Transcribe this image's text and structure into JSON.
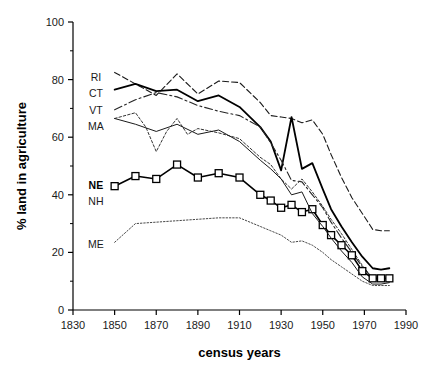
{
  "figure": {
    "background": "#ffffff",
    "ink": "#000000"
  },
  "chart_data": {
    "type": "line",
    "title": "",
    "subtitle": "",
    "xlabel": "census years",
    "ylabel": "% land in agriculture",
    "xlim": [
      1830,
      1990
    ],
    "ylim": [
      0,
      100
    ],
    "xticks": [
      1830,
      1850,
      1870,
      1890,
      1910,
      1930,
      1950,
      1970,
      1990
    ],
    "yticks": [
      0,
      20,
      40,
      60,
      80,
      100
    ],
    "xtick_labels": [
      "1830",
      "1850",
      "1870",
      "1890",
      "1910",
      "1930",
      "1950",
      "1970",
      "1990"
    ],
    "ytick_labels": [
      "0",
      "20",
      "40",
      "60",
      "80",
      "100"
    ],
    "grid": false,
    "legend_position": "inline-left",
    "minor_yticks": [
      10,
      30,
      50,
      70,
      90
    ],
    "series": [
      {
        "name": "RI",
        "label": "RI",
        "style": "dashed",
        "color": "#1a1a1a",
        "width": 1.1,
        "dash": "6,3",
        "marker": "none",
        "label_bold": false,
        "label_xy": [
          1841,
          81
        ],
        "x": [
          1850,
          1860,
          1870,
          1880,
          1890,
          1900,
          1910,
          1920,
          1925,
          1930,
          1935,
          1940,
          1945,
          1950,
          1954,
          1959,
          1964,
          1969,
          1974,
          1978,
          1982
        ],
        "values": [
          82.5,
          78.5,
          74.5,
          82.0,
          75.0,
          79.5,
          79.0,
          72.0,
          67.5,
          67.0,
          66.5,
          65.0,
          66.0,
          61.0,
          54.0,
          46.0,
          39.0,
          33.5,
          28.0,
          27.5,
          27.5
        ]
      },
      {
        "name": "CT",
        "label": "CT",
        "style": "solid",
        "color": "#000000",
        "width": 1.8,
        "dash": "none",
        "marker": "none",
        "label_bold": false,
        "label_xy": [
          1841,
          75.5
        ],
        "x": [
          1850,
          1860,
          1870,
          1880,
          1890,
          1900,
          1910,
          1920,
          1925,
          1930,
          1935,
          1940,
          1945,
          1950,
          1954,
          1959,
          1964,
          1969,
          1974,
          1978,
          1982
        ],
        "values": [
          76.5,
          78.5,
          76.0,
          76.5,
          72.5,
          74.5,
          70.5,
          63.5,
          58.5,
          48.5,
          67.0,
          49.0,
          51.0,
          42.0,
          35.0,
          29.0,
          23.5,
          18.5,
          14.5,
          14.0,
          14.5
        ]
      },
      {
        "name": "VT",
        "label": "VT",
        "style": "dashdot",
        "color": "#262626",
        "width": 1.1,
        "dash": "8,3,2,3",
        "marker": "none",
        "label_bold": false,
        "label_xy": [
          1841,
          69.5
        ],
        "x": [
          1850,
          1860,
          1870,
          1880,
          1890,
          1900,
          1910,
          1920,
          1925,
          1930,
          1935,
          1940,
          1945,
          1950,
          1954,
          1959,
          1964,
          1969,
          1974,
          1978,
          1982
        ],
        "values": [
          69.5,
          73.0,
          75.5,
          74.0,
          71.0,
          69.0,
          67.5,
          63.5,
          58.0,
          52.0,
          45.0,
          44.5,
          40.0,
          35.5,
          30.5,
          25.0,
          20.0,
          15.0,
          11.0,
          10.0,
          10.5
        ]
      },
      {
        "name": "MA",
        "label": "MA",
        "style": "dotted",
        "color": "#333333",
        "width": 1.0,
        "dash": "2.5,2",
        "marker": "none",
        "label_bold": false,
        "label_xy": [
          1841,
          64
        ],
        "x": [
          1850,
          1860,
          1865,
          1870,
          1875,
          1880,
          1885,
          1890,
          1900,
          1910,
          1920,
          1925,
          1930,
          1935,
          1940,
          1945,
          1950,
          1954,
          1959,
          1964,
          1969,
          1974,
          1978,
          1982
        ],
        "values": [
          66.5,
          68.5,
          63.5,
          55.0,
          62.0,
          66.5,
          61.0,
          63.0,
          61.5,
          59.5,
          53.0,
          50.5,
          45.5,
          42.0,
          45.5,
          41.0,
          36.0,
          31.5,
          26.5,
          21.0,
          15.5,
          11.0,
          10.5,
          11.0
        ]
      },
      {
        "name": "NE",
        "label": "NE",
        "style": "solid-marker",
        "color": "#000000",
        "width": 1.6,
        "dash": "none",
        "marker": "square",
        "marker_size": 7,
        "label_bold": true,
        "label_xy": [
          1841,
          43.5
        ],
        "x": [
          1850,
          1860,
          1870,
          1880,
          1890,
          1900,
          1910,
          1920,
          1925,
          1930,
          1935,
          1940,
          1945,
          1950,
          1954,
          1959,
          1964,
          1969,
          1974,
          1978,
          1982
        ],
        "values": [
          43.0,
          46.5,
          45.5,
          50.5,
          46.0,
          47.5,
          46.0,
          40.0,
          38.0,
          35.5,
          36.5,
          34.0,
          35.0,
          29.5,
          26.0,
          22.5,
          19.0,
          13.5,
          11.0,
          11.0,
          11.0
        ]
      },
      {
        "name": "NH",
        "label": "NH",
        "style": "thin-solid",
        "color": "#1a1a1a",
        "width": 1.0,
        "dash": "none",
        "marker": "none",
        "label_bold": false,
        "label_xy": [
          1841,
          38
        ],
        "x": [
          1850,
          1860,
          1870,
          1880,
          1890,
          1900,
          1910,
          1920,
          1925,
          1930,
          1935,
          1940,
          1945,
          1950,
          1954,
          1959,
          1964,
          1969,
          1974,
          1978,
          1982
        ],
        "values": [
          66.5,
          64.5,
          62.0,
          64.5,
          61.0,
          62.5,
          58.5,
          52.0,
          49.0,
          45.5,
          40.0,
          41.0,
          33.5,
          29.0,
          25.0,
          20.5,
          16.5,
          11.5,
          9.0,
          9.0,
          9.5
        ]
      },
      {
        "name": "ME",
        "label": "ME",
        "style": "fine-dotted",
        "color": "#333333",
        "width": 0.9,
        "dash": "1.5,1.8",
        "marker": "none",
        "label_bold": false,
        "label_xy": [
          1841,
          23
        ],
        "x": [
          1850,
          1860,
          1870,
          1880,
          1890,
          1900,
          1910,
          1920,
          1925,
          1930,
          1935,
          1940,
          1945,
          1950,
          1954,
          1959,
          1964,
          1969,
          1974,
          1978,
          1982
        ],
        "values": [
          23.5,
          30.0,
          30.5,
          31.0,
          31.5,
          32.0,
          32.0,
          29.0,
          27.5,
          26.0,
          23.5,
          24.0,
          22.5,
          20.0,
          17.5,
          15.0,
          12.5,
          10.0,
          8.5,
          8.5,
          8.5
        ]
      }
    ]
  }
}
